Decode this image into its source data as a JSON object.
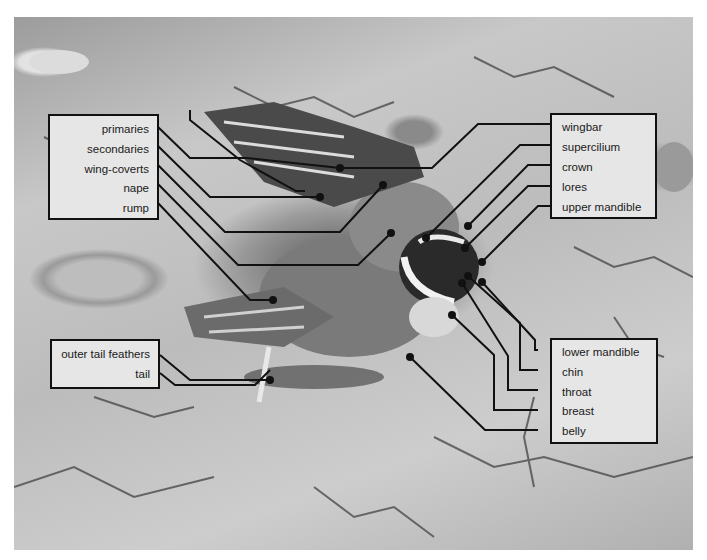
{
  "figure": {
    "background_tone": "#b8b8b8",
    "label_box_fill": "#e6e6e6",
    "line_color": "#111111"
  },
  "left_box": {
    "items": [
      "primaries",
      "secondaries",
      "wing-coverts",
      "nape",
      "rump"
    ]
  },
  "right_top_box": {
    "items": [
      "wingbar",
      "supercilium",
      "crown",
      "lores",
      "upper mandible"
    ]
  },
  "right_bottom_box": {
    "items": [
      "lower mandible",
      "chin",
      "throat",
      "breast",
      "belly"
    ]
  },
  "tail_box": {
    "items": [
      "outer tail feathers",
      "tail"
    ]
  }
}
